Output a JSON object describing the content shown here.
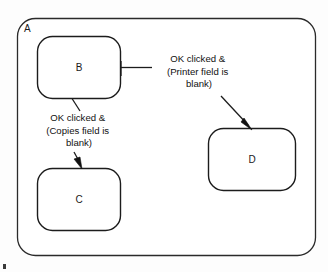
{
  "diagram": {
    "type": "statechart",
    "title": "",
    "outer_state": {
      "id": "outer-state-a",
      "label": "A"
    },
    "states": [
      {
        "id": "state-b",
        "label": "B"
      },
      {
        "id": "state-c",
        "label": "C"
      },
      {
        "id": "state-d",
        "label": "D"
      }
    ],
    "transitions": [
      {
        "id": "transition-b-to-d",
        "from": "B",
        "to": "D",
        "label_lines": [
          "OK clicked &",
          "(Printer field is",
          "blank)"
        ]
      },
      {
        "id": "transition-b-to-c",
        "from": "B",
        "to": "C",
        "label_lines": [
          "OK clicked &",
          "(Copies field is",
          "blank)"
        ]
      }
    ],
    "colors": {
      "stroke": "#1c1c1c",
      "outer_stroke": "#2a2a2a",
      "fill": "#ffffff",
      "text": "#111111",
      "background": "#fdfdfd"
    }
  }
}
